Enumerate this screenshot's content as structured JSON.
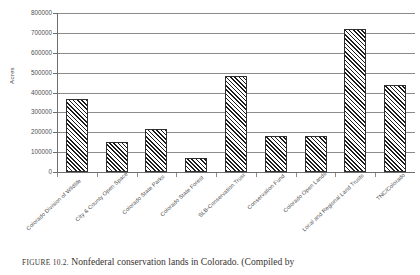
{
  "figure": {
    "caption_label": "FIGURE 10.2.",
    "caption_text": "Nonfederal conservation lands in Colorado. (Compiled by"
  },
  "chart_data": {
    "type": "bar",
    "title": "",
    "xlabel": "",
    "ylabel": "Acres",
    "ylim": [
      0,
      800000
    ],
    "ytick_step": 100000,
    "grid": true,
    "legend": "none",
    "bar_fill": "diagonal-hatch",
    "categories": [
      "Colorado Division of Wildlife",
      "City & County Open Space",
      "Colorado State Parks",
      "Colorado State Forest",
      "SLB-Conservation Trust",
      "Conservation Fund",
      "Colorado Open Lands",
      "Local and Regional Land Trusts",
      "TNC/Colorado"
    ],
    "values": [
      370000,
      150000,
      215000,
      70000,
      485000,
      180000,
      180000,
      720000,
      440000
    ],
    "ytick_labels": [
      "0",
      "100000",
      "200000",
      "300000",
      "400000",
      "500000",
      "600000",
      "700000",
      "800000"
    ],
    "ytick_values": [
      0,
      100000,
      200000,
      300000,
      400000,
      500000,
      600000,
      700000,
      800000
    ]
  },
  "colors": {
    "axis": "#6d6d6d",
    "grid": "#8b8b8b",
    "bar_edge": "#2f2f2f",
    "bar_hatch": "#1c1c1c",
    "text": "#4a4a4a",
    "background": "#ffffff"
  }
}
